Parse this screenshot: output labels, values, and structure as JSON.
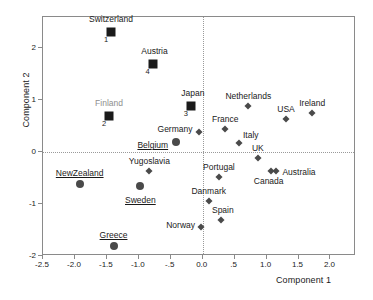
{
  "chart_data": {
    "type": "scatter",
    "title": "",
    "xlabel": "Component 1",
    "ylabel": "Component 2",
    "xlim": [
      -2.5,
      2.4
    ],
    "ylim": [
      -2.0,
      2.6
    ],
    "grid": false,
    "legend": "none",
    "reference_lines": {
      "x": 0,
      "y": 0,
      "style": "dotted"
    },
    "xticks": [
      "-2.5",
      "-2.0",
      "-1.5",
      "-1.0",
      "-.5",
      "0.0",
      ".5",
      "1.0",
      "1.5",
      "2.0"
    ],
    "xtick_values": [
      -2.5,
      -2.0,
      -1.5,
      -1.0,
      -0.5,
      0.0,
      0.5,
      1.0,
      1.5,
      2.0
    ],
    "yticks": [
      "2",
      "1",
      "0",
      "-1",
      "-2"
    ],
    "ytick_values": [
      2,
      1,
      0,
      -1,
      -2
    ],
    "points": [
      {
        "label": "Switzerland",
        "x": -1.42,
        "y": 2.3,
        "marker": "square",
        "annotation": "1",
        "label_pos": "center",
        "label_dx": 0,
        "label_dy": -13,
        "label_style": "plain"
      },
      {
        "label": "Austria",
        "x": -0.77,
        "y": 1.68,
        "marker": "square",
        "annotation": "4",
        "label_pos": "center",
        "label_dx": 2,
        "label_dy": -13,
        "label_style": "plain"
      },
      {
        "label": "Japan",
        "x": -0.17,
        "y": 0.86,
        "marker": "square",
        "annotation": "3",
        "label_pos": "center",
        "label_dx": 2,
        "label_dy": -13,
        "label_style": "plain"
      },
      {
        "label": "Finland",
        "x": -1.45,
        "y": 0.67,
        "marker": "square",
        "annotation": "2",
        "label_pos": "center",
        "label_dx": 0,
        "label_dy": -13,
        "label_style": "gray"
      },
      {
        "label": "Belgium",
        "x": -0.4,
        "y": 0.17,
        "marker": "circle",
        "annotation": "",
        "label_pos": "right",
        "label_dx": -8,
        "label_dy": 3,
        "label_style": "underline"
      },
      {
        "label": "NewZealand",
        "x": -1.91,
        "y": -0.63,
        "marker": "circle",
        "annotation": "",
        "label_pos": "center",
        "label_dx": 0,
        "label_dy": -11,
        "label_style": "underline"
      },
      {
        "label": "Sweden",
        "x": -0.96,
        "y": -0.68,
        "marker": "center",
        "annotation": "",
        "label_pos": "center",
        "label_dx": 0,
        "label_dy": 14,
        "label_style": "underline"
      },
      {
        "label": "Greece",
        "x": -1.38,
        "y": -1.82,
        "marker": "circle",
        "annotation": "",
        "label_pos": "center",
        "label_dx": 0,
        "label_dy": -11,
        "label_style": "underline"
      },
      {
        "label": "Germany",
        "x": -0.05,
        "y": 0.37,
        "marker": "diamond",
        "annotation": "",
        "label_pos": "right",
        "label_dx": -6,
        "label_dy": -3,
        "label_style": "plain"
      },
      {
        "label": "Yugoslavia",
        "x": -0.82,
        "y": -0.39,
        "marker": "diamond",
        "annotation": "",
        "label_pos": "center",
        "label_dx": 0,
        "label_dy": -10,
        "label_style": "plain"
      },
      {
        "label": "Netherlands",
        "x": 0.73,
        "y": 0.86,
        "marker": "diamond",
        "annotation": "",
        "label_pos": "center",
        "label_dx": 0,
        "label_dy": -10,
        "label_style": "plain"
      },
      {
        "label": "USA",
        "x": 1.32,
        "y": 0.61,
        "marker": "diamond",
        "annotation": "",
        "label_pos": "center",
        "label_dx": 0,
        "label_dy": -10,
        "label_style": "plain"
      },
      {
        "label": "Ireland",
        "x": 1.73,
        "y": 0.73,
        "marker": "diamond",
        "annotation": "",
        "label_pos": "center",
        "label_dx": 0,
        "label_dy": -10,
        "label_style": "plain"
      },
      {
        "label": "France",
        "x": 0.37,
        "y": 0.43,
        "marker": "diamond",
        "annotation": "",
        "label_pos": "center",
        "label_dx": 0,
        "label_dy": -10,
        "label_style": "plain"
      },
      {
        "label": "Italy",
        "x": 0.58,
        "y": 0.16,
        "marker": "diamond",
        "annotation": "",
        "label_pos": "center",
        "label_dx": 12,
        "label_dy": -8,
        "label_style": "plain"
      },
      {
        "label": "UK",
        "x": 0.88,
        "y": -0.13,
        "marker": "diamond",
        "annotation": "",
        "label_pos": "center",
        "label_dx": 0,
        "label_dy": -10,
        "label_style": "plain"
      },
      {
        "label": "Portugal",
        "x": 0.27,
        "y": -0.5,
        "marker": "diamond",
        "annotation": "",
        "label_pos": "center",
        "label_dx": 0,
        "label_dy": -10,
        "label_style": "plain"
      },
      {
        "label": "Canada",
        "x": 1.08,
        "y": -0.39,
        "marker": "diamond",
        "annotation": "",
        "label_pos": "center",
        "label_dx": -2,
        "label_dy": 10,
        "label_style": "plain"
      },
      {
        "label": "Australia",
        "x": 1.17,
        "y": -0.39,
        "marker": "diamond",
        "annotation": "",
        "label_pos": "left",
        "label_dx": 6,
        "label_dy": 1,
        "label_style": "plain"
      },
      {
        "label": "Danmark",
        "x": 0.11,
        "y": -0.96,
        "marker": "diamond",
        "annotation": "",
        "label_pos": "center",
        "label_dx": 0,
        "label_dy": -10,
        "label_style": "plain"
      },
      {
        "label": "Spain",
        "x": 0.3,
        "y": -1.33,
        "marker": "diamond",
        "annotation": "",
        "label_pos": "center",
        "label_dx": 2,
        "label_dy": -10,
        "label_style": "plain"
      },
      {
        "label": "Norway",
        "x": -0.01,
        "y": -1.46,
        "marker": "diamond",
        "annotation": "",
        "label_pos": "right",
        "label_dx": -6,
        "label_dy": -2,
        "label_style": "plain"
      }
    ]
  }
}
